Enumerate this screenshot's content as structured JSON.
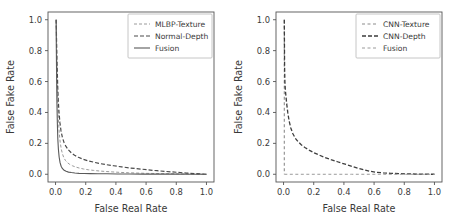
{
  "figure": {
    "background": "#ffffff",
    "axis_color": "#555555",
    "text_color": "#3a3a3a"
  },
  "chart_data": [
    {
      "type": "line",
      "title": "",
      "xlabel": "False Real Rate",
      "ylabel": "False Fake Rate",
      "xlim": [
        -0.05,
        1.05
      ],
      "ylim": [
        -0.05,
        1.05
      ],
      "xticks": [
        0.0,
        0.2,
        0.4,
        0.6,
        0.8,
        1.0
      ],
      "yticks": [
        0.0,
        0.2,
        0.4,
        0.6,
        0.8,
        1.0
      ],
      "xticklabels": [
        "0.0",
        "0.2",
        "0.4",
        "0.6",
        "0.8",
        "1.0"
      ],
      "yticklabels": [
        "0.0",
        "0.2",
        "0.4",
        "0.6",
        "0.8",
        "1.0"
      ],
      "grid": false,
      "legend_position": "upper right",
      "series": [
        {
          "name": "MLBP-Texture",
          "style": "dashed",
          "color": "#9a9a9a",
          "width": 1.0,
          "dash": "3,2",
          "x": [
            0.004,
            0.006,
            0.008,
            0.01,
            0.013,
            0.016,
            0.02,
            0.025,
            0.031,
            0.038,
            0.046,
            0.055,
            0.066,
            0.079,
            0.094,
            0.112,
            0.133,
            0.158,
            0.186,
            0.218,
            0.253,
            0.292,
            0.334,
            0.38,
            0.43,
            0.483,
            0.54,
            0.6,
            0.663,
            0.73,
            0.8,
            0.87,
            0.935,
            1.0
          ],
          "y": [
            1.0,
            0.88,
            0.76,
            0.64,
            0.52,
            0.42,
            0.335,
            0.262,
            0.205,
            0.163,
            0.131,
            0.107,
            0.089,
            0.075,
            0.064,
            0.055,
            0.047,
            0.04,
            0.034,
            0.029,
            0.025,
            0.021,
            0.018,
            0.015,
            0.012,
            0.01,
            0.008,
            0.006,
            0.005,
            0.004,
            0.003,
            0.002,
            0.001,
            0.0
          ]
        },
        {
          "name": "Normal-Depth",
          "style": "dashed",
          "color": "#4a4a4a",
          "width": 1.2,
          "dash": "4,2",
          "x": [
            0.004,
            0.006,
            0.008,
            0.011,
            0.014,
            0.018,
            0.023,
            0.029,
            0.036,
            0.045,
            0.056,
            0.069,
            0.085,
            0.104,
            0.126,
            0.151,
            0.18,
            0.213,
            0.25,
            0.291,
            0.336,
            0.385,
            0.437,
            0.492,
            0.55,
            0.61,
            0.672,
            0.736,
            0.8,
            0.866,
            0.933,
            1.0
          ],
          "y": [
            1.0,
            0.905,
            0.8,
            0.69,
            0.58,
            0.48,
            0.4,
            0.334,
            0.282,
            0.24,
            0.206,
            0.18,
            0.158,
            0.139,
            0.123,
            0.11,
            0.098,
            0.088,
            0.079,
            0.07,
            0.062,
            0.055,
            0.048,
            0.041,
            0.035,
            0.029,
            0.023,
            0.018,
            0.013,
            0.008,
            0.004,
            0.0
          ]
        },
        {
          "name": "Fusion",
          "style": "solid",
          "color": "#595959",
          "width": 1.1,
          "dash": "",
          "x": [
            0.004,
            0.005,
            0.007,
            0.009,
            0.012,
            0.015,
            0.019,
            0.024,
            0.03,
            0.037,
            0.046,
            0.057,
            0.07,
            0.086,
            0.105,
            0.128,
            0.156,
            0.19,
            0.23,
            0.28,
            0.34,
            0.41,
            0.49,
            0.58,
            0.68,
            0.79,
            0.9,
            1.0
          ],
          "y": [
            1.0,
            0.83,
            0.64,
            0.47,
            0.33,
            0.23,
            0.16,
            0.11,
            0.075,
            0.052,
            0.036,
            0.026,
            0.019,
            0.014,
            0.011,
            0.008,
            0.006,
            0.005,
            0.004,
            0.003,
            0.003,
            0.002,
            0.002,
            0.001,
            0.001,
            0.001,
            0.0,
            0.0
          ]
        }
      ]
    },
    {
      "type": "line",
      "title": "",
      "xlabel": "False Real Rate",
      "ylabel": "False Fake Rate",
      "xlim": [
        -0.05,
        1.05
      ],
      "ylim": [
        -0.05,
        1.05
      ],
      "xticks": [
        0.0,
        0.2,
        0.4,
        0.6,
        0.8,
        1.0
      ],
      "yticks": [
        0.0,
        0.2,
        0.4,
        0.6,
        0.8,
        1.0
      ],
      "xticklabels": [
        "0.0",
        "0.2",
        "0.4",
        "0.6",
        "0.8",
        "1.0"
      ],
      "yticklabels": [
        "0.0",
        "0.2",
        "0.4",
        "0.6",
        "0.8",
        "1.0"
      ],
      "grid": false,
      "legend_position": "upper right",
      "series": [
        {
          "name": "CNN-Texture",
          "style": "dashed",
          "color": "#8c8c8c",
          "width": 1.1,
          "dash": "3,2.5",
          "x": [
            0.005,
            0.005,
            0.005,
            0.005,
            0.005,
            0.005,
            0.005,
            0.005,
            0.005
          ],
          "y": [
            1.0,
            0.875,
            0.75,
            0.625,
            0.5,
            0.375,
            0.25,
            0.125,
            0.0
          ]
        },
        {
          "name": "CNN-Depth",
          "style": "dashed",
          "color": "#3d3d3d",
          "width": 1.3,
          "dash": "4,2",
          "x": [
            0.005,
            0.006,
            0.007,
            0.009,
            0.012,
            0.016,
            0.021,
            0.028,
            0.037,
            0.048,
            0.062,
            0.078,
            0.097,
            0.119,
            0.144,
            0.172,
            0.203,
            0.237,
            0.274,
            0.314,
            0.357,
            0.402,
            0.448,
            0.492,
            0.535,
            0.575,
            0.615,
            0.66,
            0.71,
            0.77,
            0.84,
            0.92,
            1.0
          ],
          "y": [
            1.0,
            0.83,
            0.69,
            0.6,
            0.545,
            0.505,
            0.455,
            0.4,
            0.345,
            0.3,
            0.262,
            0.233,
            0.21,
            0.19,
            0.172,
            0.155,
            0.139,
            0.124,
            0.109,
            0.095,
            0.081,
            0.067,
            0.053,
            0.04,
            0.028,
            0.019,
            0.013,
            0.009,
            0.006,
            0.004,
            0.002,
            0.001,
            0.0
          ]
        },
        {
          "name": "Fusion",
          "style": "dashed",
          "color": "#9a9a9a",
          "width": 1.0,
          "dash": "3,2.5",
          "x": [
            0.005,
            0.15,
            0.3,
            0.45,
            0.6,
            0.75,
            0.9,
            1.0
          ],
          "y": [
            0.0,
            0.0,
            0.0,
            0.0,
            0.0,
            0.0,
            0.0,
            0.0
          ]
        }
      ]
    }
  ]
}
